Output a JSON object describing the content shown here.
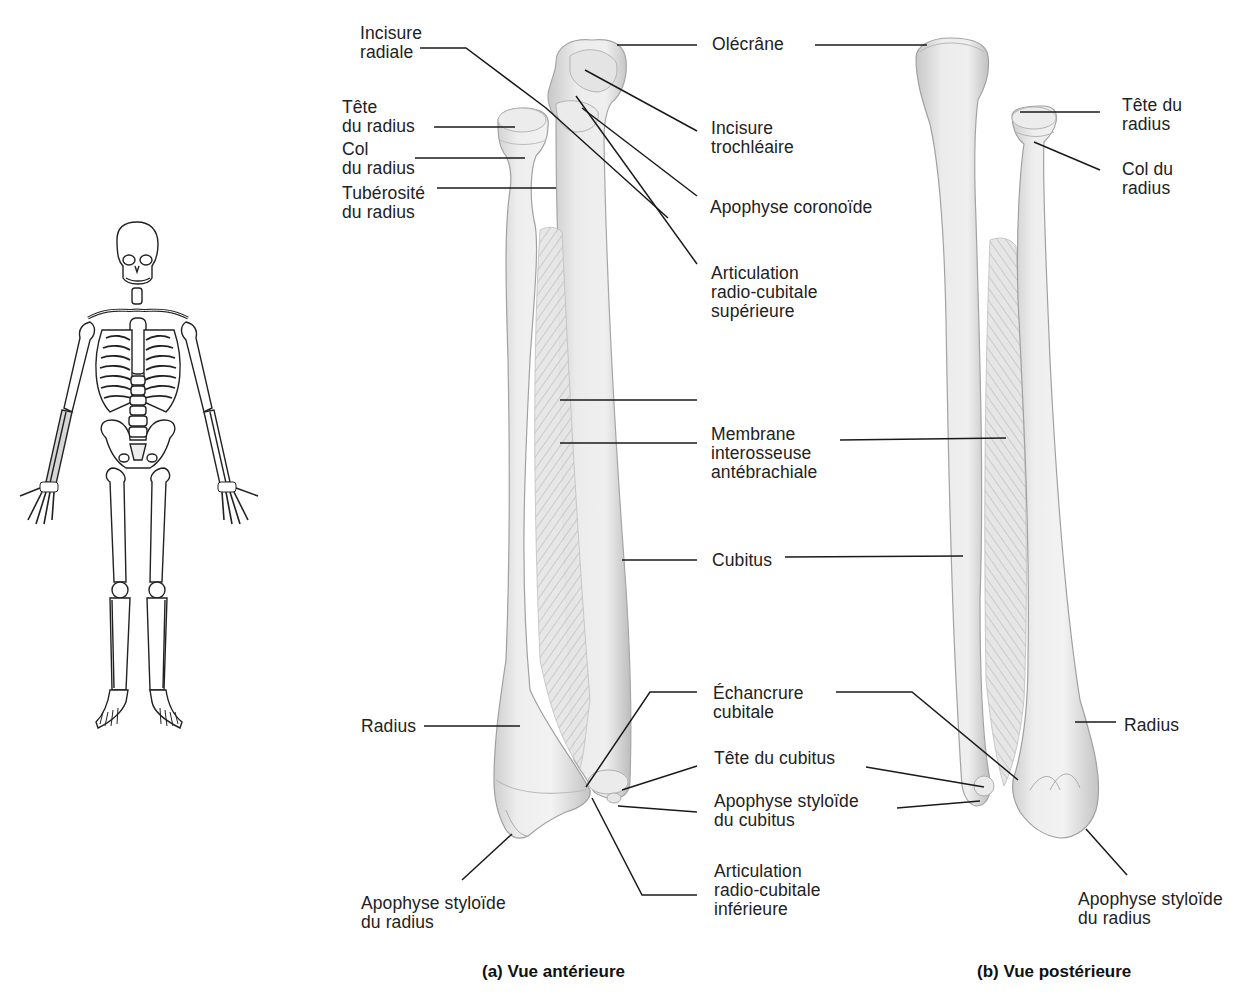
{
  "figure": {
    "captions": {
      "anterior": "(a) Vue antérieure",
      "posterior": "(b) Vue postérieure"
    },
    "colors": {
      "bone_fill": "#ececec",
      "bone_shade": "#c9c9c9",
      "bone_outline": "#9a9a9a",
      "leader_line": "#1a1a1a",
      "text": "#222222",
      "background": "#ffffff",
      "skeleton_highlight": "#d6d6d6"
    }
  },
  "anterior_labels": {
    "incisure_radiale": [
      "Incisure",
      "radiale"
    ],
    "tete_radius": [
      "Tête",
      "du radius"
    ],
    "col_radius": [
      "Col",
      "du radius"
    ],
    "tuberosite_radius": [
      "Tubérosité",
      "du radius"
    ],
    "radius": [
      "Radius"
    ],
    "apophyse_styloide_radius": [
      "Apophyse styloïde",
      "du radius"
    ]
  },
  "center_labels": {
    "olecrane": [
      "Olécrâne"
    ],
    "incisure_trochleaire": [
      "Incisure",
      "trochléaire"
    ],
    "apophyse_coronoide": [
      "Apophyse coronoïde"
    ],
    "articulation_sup": [
      "Articulation",
      "radio-cubitale",
      "supérieure"
    ],
    "membrane": [
      "Membrane",
      "interosseuse",
      "antébrachiale"
    ],
    "cubitus": [
      "Cubitus"
    ],
    "echancrure": [
      "Échancrure",
      "cubitale"
    ],
    "tete_cubitus": [
      "Tête du cubitus"
    ],
    "apophyse_styloide_cubitus": [
      "Apophyse styloïde",
      "du cubitus"
    ],
    "articulation_inf": [
      "Articulation",
      "radio-cubitale",
      "inférieure"
    ]
  },
  "posterior_labels": {
    "tete_radius": [
      "Tête du",
      "radius"
    ],
    "col_radius": [
      "Col du",
      "radius"
    ],
    "radius": [
      "Radius"
    ],
    "apophyse_styloide_radius": [
      "Apophyse styloïde",
      "du radius"
    ]
  }
}
